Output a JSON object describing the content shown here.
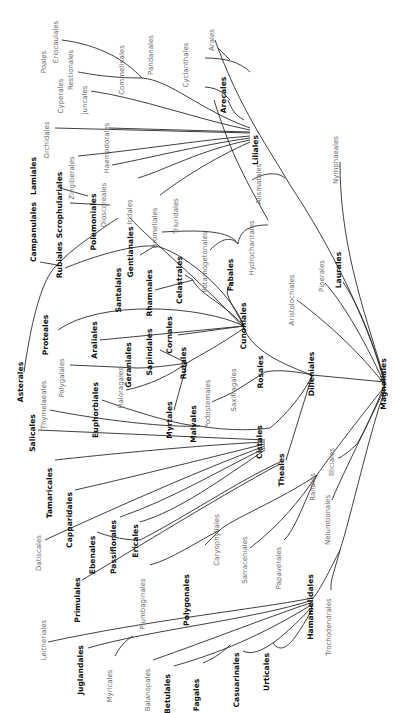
{
  "diagram": {
    "type": "phylogenetic-tree",
    "orientation": "rotated 90° counter-clockwise (labels read bottom-to-top)",
    "root": "Magnoliales",
    "colors": {
      "line": "#2a2a2a",
      "major_label": "#111111",
      "minor_label": "#6a6a6a",
      "background": "#ffffff"
    },
    "labels": [
      {
        "id": "poales",
        "text": "Poales",
        "x": 46,
        "y": 62,
        "style": "minor"
      },
      {
        "id": "eriocaulales",
        "text": "Eriocaulales",
        "x": 58,
        "y": 42,
        "style": "minor"
      },
      {
        "id": "restionales",
        "text": "Restionales",
        "x": 73,
        "y": 70,
        "style": "minor"
      },
      {
        "id": "cyperales",
        "text": "Cyperales",
        "x": 63,
        "y": 96,
        "style": "minor"
      },
      {
        "id": "juncales",
        "text": "Juncales",
        "x": 87,
        "y": 100,
        "style": "minor"
      },
      {
        "id": "commelinales",
        "text": "Commelinales",
        "x": 124,
        "y": 70,
        "style": "minor"
      },
      {
        "id": "pandanales",
        "text": "Pandanales",
        "x": 153,
        "y": 55,
        "style": "minor"
      },
      {
        "id": "cyclanthales",
        "text": "Cyclanthales",
        "x": 188,
        "y": 65,
        "style": "minor"
      },
      {
        "id": "arales",
        "text": "Arales",
        "x": 214,
        "y": 40,
        "style": "minor"
      },
      {
        "id": "arecales",
        "text": "Arecales",
        "x": 226,
        "y": 95,
        "style": "major"
      },
      {
        "id": "orchidales",
        "text": "Orchidales",
        "x": 49,
        "y": 140,
        "style": "minor"
      },
      {
        "id": "haemodorales",
        "text": "Haemodorales",
        "x": 109,
        "y": 148,
        "style": "minor"
      },
      {
        "id": "zingiberales",
        "text": "Zingiberales",
        "x": 74,
        "y": 178,
        "style": "minor"
      },
      {
        "id": "dioscoreales",
        "text": "Dioscoreales",
        "x": 106,
        "y": 205,
        "style": "minor"
      },
      {
        "id": "iridales",
        "text": "Iridales",
        "x": 132,
        "y": 212,
        "style": "minor"
      },
      {
        "id": "bromeliales",
        "text": "Bromeliales",
        "x": 157,
        "y": 228,
        "style": "minor"
      },
      {
        "id": "liliales",
        "text": "Liliales",
        "x": 258,
        "y": 150,
        "style": "major"
      },
      {
        "id": "triuridales",
        "text": "Triuridales",
        "x": 178,
        "y": 216,
        "style": "minor"
      },
      {
        "id": "alismatales",
        "text": "Alismatales",
        "x": 261,
        "y": 184,
        "style": "minor"
      },
      {
        "id": "hydrocharitales",
        "text": "Hydrocharitales",
        "x": 254,
        "y": 248,
        "style": "minor"
      },
      {
        "id": "potamogetonales",
        "text": "Potamogetonales",
        "x": 207,
        "y": 262,
        "style": "minor"
      },
      {
        "id": "nymphaeales",
        "text": "Nymphaeales",
        "x": 338,
        "y": 160,
        "style": "minor"
      },
      {
        "id": "lamiales",
        "text": "Lamiales",
        "x": 36,
        "y": 176,
        "style": "major"
      },
      {
        "id": "scrophulariales",
        "text": "Scrophulariales",
        "x": 62,
        "y": 205,
        "style": "major"
      },
      {
        "id": "polemoniales",
        "text": "Polemoniales",
        "x": 96,
        "y": 222,
        "style": "major"
      },
      {
        "id": "campanulales",
        "text": "Campanulales",
        "x": 36,
        "y": 232,
        "style": "major"
      },
      {
        "id": "rubiales",
        "text": "Rubiales",
        "x": 62,
        "y": 260,
        "style": "major"
      },
      {
        "id": "gentianales",
        "text": "Gentianales",
        "x": 133,
        "y": 252,
        "style": "major"
      },
      {
        "id": "santalales",
        "text": "Santalales",
        "x": 121,
        "y": 290,
        "style": "major"
      },
      {
        "id": "rhamnales",
        "text": "Rhamnales",
        "x": 152,
        "y": 293,
        "style": "major"
      },
      {
        "id": "celastrales",
        "text": "Celastrales",
        "x": 182,
        "y": 280,
        "style": "major"
      },
      {
        "id": "fabales",
        "text": "Fabales",
        "x": 233,
        "y": 275,
        "style": "major"
      },
      {
        "id": "aristolochiales",
        "text": "Aristolochiales",
        "x": 294,
        "y": 300,
        "style": "minor"
      },
      {
        "id": "piperales",
        "text": "Piperales",
        "x": 324,
        "y": 276,
        "style": "minor"
      },
      {
        "id": "laurales",
        "text": "Laurales",
        "x": 341,
        "y": 270,
        "style": "major"
      },
      {
        "id": "proteales",
        "text": "Proteales",
        "x": 48,
        "y": 335,
        "style": "major"
      },
      {
        "id": "araliales",
        "text": "Araliales",
        "x": 97,
        "y": 340,
        "style": "major"
      },
      {
        "id": "cornales",
        "text": "Cornales",
        "x": 172,
        "y": 335,
        "style": "major"
      },
      {
        "id": "cunoniales",
        "text": "Cunoniales",
        "x": 246,
        "y": 326,
        "style": "major"
      },
      {
        "id": "sapindales",
        "text": "Sapindales",
        "x": 152,
        "y": 352,
        "style": "major"
      },
      {
        "id": "rutales",
        "text": "Rutales",
        "x": 186,
        "y": 363,
        "style": "major"
      },
      {
        "id": "geraniales",
        "text": "Geraniales",
        "x": 131,
        "y": 365,
        "style": "major"
      },
      {
        "id": "asterales",
        "text": "Asterales",
        "x": 23,
        "y": 382,
        "style": "major"
      },
      {
        "id": "polygalales",
        "text": "Polygalales",
        "x": 64,
        "y": 378,
        "style": "minor"
      },
      {
        "id": "haloragales",
        "text": "Haloragales",
        "x": 123,
        "y": 388,
        "style": "minor"
      },
      {
        "id": "euphorbiales",
        "text": "Euphorbiales",
        "x": 98,
        "y": 410,
        "style": "major"
      },
      {
        "id": "thymelaeales",
        "text": "Thymelaeales",
        "x": 46,
        "y": 405,
        "style": "minor"
      },
      {
        "id": "myrtales",
        "text": "Myrtales",
        "x": 172,
        "y": 420,
        "style": "major"
      },
      {
        "id": "malvales",
        "text": "Malvales",
        "x": 196,
        "y": 424,
        "style": "major"
      },
      {
        "id": "podostemales",
        "text": "Podostemales",
        "x": 210,
        "y": 404,
        "style": "minor"
      },
      {
        "id": "saxifragales",
        "text": "Saxifragales",
        "x": 236,
        "y": 390,
        "style": "minor"
      },
      {
        "id": "rosales",
        "text": "Rosales",
        "x": 263,
        "y": 372,
        "style": "major"
      },
      {
        "id": "dilleniales",
        "text": "Dilleniales",
        "x": 314,
        "y": 374,
        "style": "major"
      },
      {
        "id": "magnoliales",
        "text": "Magnoliales",
        "x": 386,
        "y": 384,
        "style": "major"
      },
      {
        "id": "salicales",
        "text": "Salicales",
        "x": 35,
        "y": 433,
        "style": "major"
      },
      {
        "id": "tamaricales",
        "text": "Tamaricales",
        "x": 52,
        "y": 493,
        "style": "major"
      },
      {
        "id": "capparidales",
        "text": "Capparidales",
        "x": 72,
        "y": 520,
        "style": "major"
      },
      {
        "id": "illiciales",
        "text": "Illiciales",
        "x": 334,
        "y": 462,
        "style": "minor"
      },
      {
        "id": "cistales",
        "text": "Cistales",
        "x": 262,
        "y": 442,
        "style": "major"
      },
      {
        "id": "theales",
        "text": "Theales",
        "x": 284,
        "y": 470,
        "style": "major"
      },
      {
        "id": "datiscales",
        "text": "Datiscales",
        "x": 41,
        "y": 553,
        "style": "minor"
      },
      {
        "id": "ebenales",
        "text": "Ebenales",
        "x": 95,
        "y": 555,
        "style": "major"
      },
      {
        "id": "passiflorales",
        "text": "Passiflorales",
        "x": 116,
        "y": 547,
        "style": "major"
      },
      {
        "id": "ericales",
        "text": "Ericales",
        "x": 138,
        "y": 541,
        "style": "major"
      },
      {
        "id": "ranales",
        "text": "Ranales",
        "x": 315,
        "y": 487,
        "style": "minor"
      },
      {
        "id": "nelumbonales",
        "text": "Nelumbonales",
        "x": 330,
        "y": 520,
        "style": "minor"
      },
      {
        "id": "primulales",
        "text": "Primulales",
        "x": 80,
        "y": 600,
        "style": "major"
      },
      {
        "id": "plumbaginales",
        "text": "Plumbaginales",
        "x": 145,
        "y": 604,
        "style": "minor"
      },
      {
        "id": "caryophyllales",
        "text": "Caryophyllales",
        "x": 219,
        "y": 540,
        "style": "minor"
      },
      {
        "id": "sarraceniales",
        "text": "Sarraceniales",
        "x": 247,
        "y": 560,
        "style": "minor"
      },
      {
        "id": "papaverales",
        "text": "Papaverales",
        "x": 281,
        "y": 568,
        "style": "minor"
      },
      {
        "id": "polygonales",
        "text": "Polygonales",
        "x": 189,
        "y": 600,
        "style": "major"
      },
      {
        "id": "hamamelidales",
        "text": "Hamamelidales",
        "x": 313,
        "y": 607,
        "style": "major"
      },
      {
        "id": "trochodendrales",
        "text": "Trochodendrales",
        "x": 331,
        "y": 627,
        "style": "minor"
      },
      {
        "id": "leitneriales",
        "text": "Leitneriales",
        "x": 46,
        "y": 640,
        "style": "minor"
      },
      {
        "id": "juglandales",
        "text": "Juglandales",
        "x": 83,
        "y": 670,
        "style": "major"
      },
      {
        "id": "myricales",
        "text": "Myricales",
        "x": 112,
        "y": 686,
        "style": "minor"
      },
      {
        "id": "balanopales",
        "text": "Balanopales",
        "x": 150,
        "y": 690,
        "style": "minor"
      },
      {
        "id": "betulales",
        "text": "Betulales",
        "x": 170,
        "y": 694,
        "style": "major"
      },
      {
        "id": "fagales",
        "text": "Fagales",
        "x": 199,
        "y": 695,
        "style": "major"
      },
      {
        "id": "casuarinales",
        "text": "Casuarinales",
        "x": 239,
        "y": 680,
        "style": "major"
      },
      {
        "id": "urticales",
        "text": "Urticales",
        "x": 269,
        "y": 672,
        "style": "major"
      }
    ],
    "edges": [
      "M385 382 C 360 300, 320 230, 290 185",
      "M290 185 C 270 150, 240 110, 215 40",
      "M230 60 L 218 48",
      "M268 220 C 240 170, 230 150, 214 100",
      "M244 120 C 235 115, 232 110, 228 100",
      "M250 72 C 240 62, 225 58, 205 58",
      "M230 100 C 225 95, 220 88, 205 87",
      "M250 128 C 200 110, 170 80, 142 78",
      "M142 78 C 125 60, 100 45, 62 40",
      "M142 78 C 110 78, 90 74, 78 72",
      "M250 130 C 200 120, 140 98, 91 91",
      "M250 132 L 109 128",
      "M250 133 L 55 128",
      "M250 136 C 200 140, 140 150, 78 156",
      "M250 138 C 200 145, 140 160, 112 165",
      "M250 140 C 200 150, 165 170, 138 178",
      "M250 142 C 210 160, 180 180, 160 195",
      "M268 225 C 250 225, 240 230, 238 244",
      "M238 244 C 230 235, 220 240, 210 250",
      "M238 244 C 230 230, 200 230, 162 232",
      "M285 178 C 275 170, 260 175, 252 180",
      "M385 380 C 360 300, 340 240, 340 162",
      "M385 385 C 350 340, 310 310, 297 300",
      "M385 385 C 360 330, 340 300, 325 283",
      "M385 385 C 370 330, 355 300, 343 282",
      "M130 218 C 150 240, 200 280, 244 328",
      "M118 218 C 100 230, 70 250, 57 265",
      "M57 265 C 40 280, 30 330, 24 372",
      "M57 265 L 40 262",
      "M110 205 L 70 203",
      "M88 196 L 60 188",
      "M155 246 C 140 245, 110 250, 65 268",
      "M155 246 C 180 250, 230 290, 244 326",
      "M155 246 L 140 255",
      "M244 326 C 220 300, 200 295, 193 280",
      "M193 280 L 155 290",
      "M193 280 L 185 275",
      "M244 326 C 230 300, 220 290, 234 282",
      "M244 326 L 100 340",
      "M244 326 C 200 305, 100 300, 58 330",
      "M244 326 L 178 335",
      "M244 328 C 220 345, 200 355, 187 363",
      "M187 363 L 160 350",
      "M187 363 C 175 365, 150 368, 138 368",
      "M187 363 C 170 375, 150 385, 126 390",
      "M187 363 L 174 410",
      "M138 368 L 70 365",
      "M244 328 C 250 345, 270 360, 312 375",
      "M312 375 L 385 382",
      "M312 375 C 290 370, 275 370, 265 372",
      "M265 372 L 240 388",
      "M240 388 C 230 395, 215 400, 212 402",
      "M312 376 C 300 400, 280 420, 270 428",
      "M270 428 C 240 432, 210 428, 200 426",
      "M200 426 C 180 426, 130 410, 102 400",
      "M200 426 C 170 428, 100 420, 50 410",
      "M312 376 L 286 460",
      "M265 440 L 38 430",
      "M265 442 C 200 445, 100 455, 55 460",
      "M265 444 C 200 460, 120 480, 75 490",
      "M265 446 C 200 470, 110 510, 45 540",
      "M265 448 C 220 470, 170 500, 120 517",
      "M265 450 C 220 480, 180 510, 140 522",
      "M280 462 C 240 480, 180 520, 140 540",
      "M140 540 C 120 540, 105 535, 97 532",
      "M280 464 C 230 490, 150 540, 82 580",
      "M385 384 C 370 420, 360 440, 356 445",
      "M356 445 C 345 455, 340 458, 338 458",
      "M385 386 C 350 430, 320 470, 317 475",
      "M317 475 C 280 500, 230 520, 220 530",
      "M220 530 C 200 540, 170 560, 150 565",
      "M220 530 L 205 545",
      "M317 475 C 300 500, 280 525, 250 548",
      "M317 475 C 305 500, 295 530, 284 540",
      "M385 388 C 360 440, 340 480, 332 500",
      "M385 390 C 370 430, 350 520, 340 550",
      "M340 550 C 330 570, 320 590, 313 598",
      "M340 550 C 335 570, 330 580, 331 590",
      "M313 598 C 250 610, 150 620, 48 642",
      "M313 600 C 250 620, 150 630, 88 648",
      "M133 636 C 125 640, 118 650, 115 656",
      "M313 602 C 260 620, 210 640, 153 660",
      "M313 604 C 270 630, 230 650, 174 666",
      "M230 645 C 220 655, 210 660, 203 663",
      "M313 606 C 290 630, 260 660, 243 651",
      "M313 608 C 300 630, 285 660, 273 643"
    ]
  }
}
